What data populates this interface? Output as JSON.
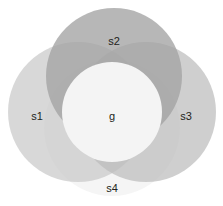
{
  "diagram": {
    "type": "venn-set-diagram",
    "width": 223,
    "height": 206,
    "background_color": "#ffffff",
    "label_color": "#231f20",
    "sets": [
      {
        "id": "s1",
        "label": "s1",
        "position": "left",
        "cx": 78,
        "cy": 112,
        "r": 70,
        "fill": "#c9c9c9",
        "opacity": 0.72,
        "label_x": 37,
        "label_y": 117
      },
      {
        "id": "s2",
        "label": "s2",
        "position": "top",
        "cx": 114,
        "cy": 76,
        "r": 68,
        "fill": "#a3a3a3",
        "opacity": 0.78,
        "label_x": 114,
        "label_y": 42
      },
      {
        "id": "s3",
        "label": "s3",
        "position": "right",
        "cx": 146,
        "cy": 112,
        "r": 70,
        "fill": "#bdbdbd",
        "opacity": 0.72,
        "label_x": 186,
        "label_y": 117
      },
      {
        "id": "s4",
        "label": "s4",
        "position": "bottom",
        "cx": 112,
        "cy": 128,
        "r": 68,
        "fill": "#ededed",
        "opacity": 0.55,
        "label_x": 112,
        "label_y": 189
      }
    ],
    "intersection": {
      "id": "g",
      "label": "g",
      "cx": 112,
      "cy": 112,
      "r": 50,
      "fill": "#f4f4f4",
      "opacity": 1,
      "label_x": 112,
      "label_y": 117
    }
  }
}
